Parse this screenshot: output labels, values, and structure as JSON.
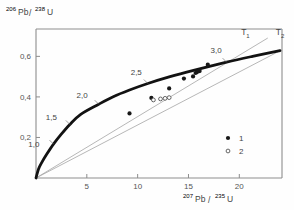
{
  "figure": {
    "background": "#fefefe",
    "frame_color": "#8d8d8d",
    "curve_color": "#111111",
    "line_color": "#9a9a9a",
    "point_color": "#1a1a1a"
  },
  "axes": {
    "y_label": {
      "pre": "206",
      "mid": "Pb",
      "slash": "/",
      "post": "238",
      "end": "U",
      "full": "206Pb/238U"
    },
    "x_label": {
      "pre": "207",
      "mid": "Pb",
      "slash": "/",
      "post": "235",
      "end": "U",
      "full": "207Pb/235U"
    },
    "x_ticks": [
      {
        "value": 5,
        "label": "5"
      },
      {
        "value": 10,
        "label": "10"
      },
      {
        "value": 15,
        "label": "15"
      },
      {
        "value": 20,
        "label": "20"
      }
    ],
    "y_ticks": [
      {
        "value": 0.2,
        "label": "0,2"
      },
      {
        "value": 0.4,
        "label": "0,4"
      },
      {
        "value": 0.6,
        "label": "0,6"
      }
    ],
    "xlim": [
      0,
      24.2
    ],
    "ylim": [
      0,
      0.735
    ],
    "grid": false
  },
  "chart_data": {
    "type": "scatter",
    "title": "",
    "xlabel": "207Pb/235U",
    "ylabel": "206Pb/238U",
    "xlim": [
      0,
      24.2
    ],
    "ylim": [
      0,
      0.735
    ],
    "grid": false,
    "legend_position": "lower-right",
    "concordia": {
      "name": "concordia-curve",
      "tick_labels": [
        {
          "age": "1,0",
          "x": 1.72,
          "y": 0.1674
        },
        {
          "age": "1,5",
          "x": 3.33,
          "y": 0.2643
        },
        {
          "age": "2,0",
          "x": 6.17,
          "y": 0.3639
        },
        {
          "age": "2,5",
          "x": 11.0,
          "y": 0.4661
        },
        {
          "age": "3,0",
          "x": 18.75,
          "y": 0.5715
        }
      ],
      "points": [
        {
          "x": 0.0,
          "y": 0.0
        },
        {
          "x": 0.25,
          "y": 0.0445
        },
        {
          "x": 0.6,
          "y": 0.0795
        },
        {
          "x": 1.05,
          "y": 0.117
        },
        {
          "x": 1.72,
          "y": 0.1674
        },
        {
          "x": 2.45,
          "y": 0.214
        },
        {
          "x": 3.33,
          "y": 0.2643
        },
        {
          "x": 4.4,
          "y": 0.314
        },
        {
          "x": 6.17,
          "y": 0.3639
        },
        {
          "x": 7.6,
          "y": 0.401
        },
        {
          "x": 9.2,
          "y": 0.434
        },
        {
          "x": 11.0,
          "y": 0.4661
        },
        {
          "x": 13.1,
          "y": 0.4985
        },
        {
          "x": 15.5,
          "y": 0.531
        },
        {
          "x": 18.75,
          "y": 0.5715
        },
        {
          "x": 21.3,
          "y": 0.6
        },
        {
          "x": 24.0,
          "y": 0.628
        }
      ]
    },
    "discordia_lines": [
      {
        "name": "discordia-upper",
        "x1": 0.0,
        "y1": 0.0,
        "x2": 22.8,
        "y2": 0.6905,
        "label": "T1"
      },
      {
        "name": "discordia-lower",
        "x1": 0.0,
        "y1": 0.0,
        "x2": 24.2,
        "y2": 0.633,
        "label": "T2"
      }
    ],
    "intercept_labels": [
      {
        "text": "T",
        "sub": "1",
        "x": 20.6,
        "y": 0.705
      },
      {
        "text": "T",
        "sub": "2",
        "x": 24.0,
        "y": 0.705
      }
    ],
    "series": [
      {
        "name": "1",
        "marker": "filled-circle",
        "points": [
          {
            "x": 9.2,
            "y": 0.3185
          },
          {
            "x": 11.35,
            "y": 0.395
          },
          {
            "x": 13.1,
            "y": 0.442
          },
          {
            "x": 14.55,
            "y": 0.4905
          },
          {
            "x": 15.45,
            "y": 0.501
          },
          {
            "x": 15.7,
            "y": 0.518
          },
          {
            "x": 15.85,
            "y": 0.5225
          },
          {
            "x": 16.1,
            "y": 0.5275
          },
          {
            "x": 16.9,
            "y": 0.559
          }
        ]
      },
      {
        "name": "2",
        "marker": "open-circle",
        "points": [
          {
            "x": 11.55,
            "y": 0.385
          },
          {
            "x": 12.25,
            "y": 0.39
          },
          {
            "x": 12.7,
            "y": 0.393
          },
          {
            "x": 13.1,
            "y": 0.3965
          }
        ]
      }
    ]
  },
  "legend": {
    "items": [
      {
        "marker": "filled-circle",
        "label": "1"
      },
      {
        "marker": "open-circle",
        "label": "2"
      }
    ]
  }
}
